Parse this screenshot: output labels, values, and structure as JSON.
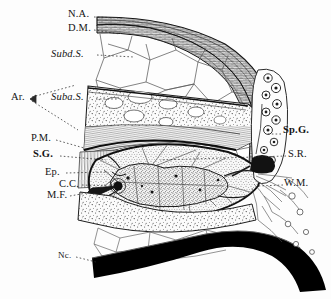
{
  "figure": {
    "background_color": "#fdfdfd",
    "ink_color": "#141414",
    "width": 331,
    "height": 299
  },
  "labels": [
    {
      "id": "na",
      "text": "N.A.",
      "x": 68,
      "y": 14,
      "style": "plain",
      "meaning": "nuchal aponeurosis"
    },
    {
      "id": "dm",
      "text": "D.M.",
      "x": 68,
      "y": 28,
      "style": "plain",
      "meaning": "dura mater"
    },
    {
      "id": "subd",
      "text": "Subd.S.",
      "x": 52,
      "y": 55,
      "style": "ital",
      "meaning": "subdural space"
    },
    {
      "id": "ar",
      "text": "Ar.",
      "x": 12,
      "y": 98,
      "style": "plain",
      "meaning": "arachnoid"
    },
    {
      "id": "suba",
      "text": "Suba.S.",
      "x": 52,
      "y": 98,
      "style": "ital",
      "meaning": "subarachnoid space"
    },
    {
      "id": "pm",
      "text": "P.M.",
      "x": 32,
      "y": 139,
      "style": "plain",
      "meaning": "pia mater"
    },
    {
      "id": "sg",
      "text": "S.G.",
      "x": 34,
      "y": 155,
      "style": "bold",
      "meaning": "spinal grey matter"
    },
    {
      "id": "ep",
      "text": "Ep.",
      "x": 46,
      "y": 172,
      "style": "plain",
      "meaning": "ependyma"
    },
    {
      "id": "cc",
      "text": "C.C.",
      "x": 60,
      "y": 184,
      "style": "plain",
      "meaning": "central canal"
    },
    {
      "id": "mf",
      "text": "M.F.",
      "x": 48,
      "y": 196,
      "style": "plain",
      "meaning": "median fissure"
    },
    {
      "id": "nc",
      "text": "Nc.",
      "x": 59,
      "y": 256,
      "style": "sm",
      "meaning": "ligamentum nuchae"
    },
    {
      "id": "spg",
      "text": "Sp.G.",
      "x": 283,
      "y": 131,
      "style": "bold",
      "meaning": "spinal ganglion"
    },
    {
      "id": "sr",
      "text": "S.R.",
      "x": 288,
      "y": 155,
      "style": "plain",
      "meaning": "spinal root"
    },
    {
      "id": "wm",
      "text": "W.M.",
      "x": 285,
      "y": 184,
      "style": "plain",
      "meaning": "white matter"
    }
  ],
  "structures": {
    "nuchal_aponeurosis": "dense banded fibrous sheet arching across the top",
    "dura_mater": "thick dark lamellar band beneath the aponeurosis",
    "subdural_space": "open polygonal trabecular meshwork",
    "arachnoid": "stippled layer with oval lacunae",
    "subarachnoid_space": "stippled zone containing white vacuoles",
    "pia_mater": "dark thin line bounding the cord",
    "spinal_cord": "large oval with butterfly grey matter and radiating fibres",
    "central_canal": "small dark point at cord centre",
    "median_fissure": "cleft entering cord from the left",
    "spinal_ganglion": "vertical chain of round ganglion cells at right",
    "spinal_root": "nerve root leaving the cord toward the ganglion",
    "ligamentum_nuchae": "solid black curved band at bottom"
  }
}
